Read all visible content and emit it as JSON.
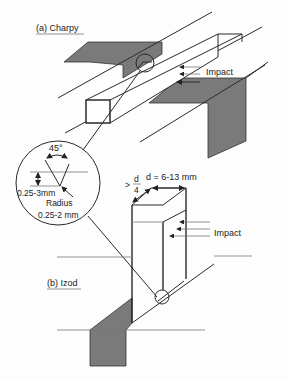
{
  "figure": {
    "panels": [
      {
        "id": "charpy",
        "label": "(a) Charpy",
        "impact_label": "Impact"
      },
      {
        "id": "izod",
        "label": "(b) Izod",
        "impact_label": "Impact"
      }
    ],
    "notch_detail": {
      "angle": "45°",
      "depth": "0.25-3mm",
      "radius_label": "Radius",
      "radius_value": "0.25-2 mm"
    },
    "izod_dimensions": {
      "width": "d = 6-13 mm",
      "depth_prefix": ">",
      "depth_numerator": "d",
      "depth_denominator": "4"
    },
    "colors": {
      "shade": "#7a7a7a",
      "line": "#2a2a2a"
    }
  }
}
